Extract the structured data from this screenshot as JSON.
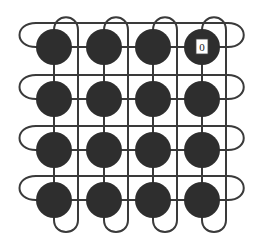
{
  "diagram": {
    "type": "folded-torus-4x4",
    "rows": 4,
    "cols": 4,
    "node_color": "#2e2e2e",
    "wire_color": "#3a3a3a",
    "labeled_node": {
      "row": 0,
      "col": 3,
      "label": "0"
    },
    "col_x": [
      54,
      104,
      153,
      202
    ],
    "row_y": [
      47,
      99,
      150,
      200
    ],
    "node_radius": 18
  }
}
